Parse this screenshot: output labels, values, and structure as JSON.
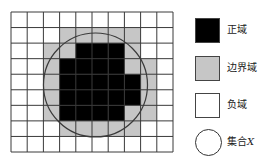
{
  "diagram": {
    "title": "",
    "grid": {
      "rows": 9,
      "cols": 10,
      "cells": [
        "WWWWWWWWWW",
        "WWWGGGGGWW",
        "WWGGBBBGWW",
        "WWGBBBBGGW",
        "WWGBBBBBGW",
        "WWGBBBBBGW",
        "WWGBBBBGGW",
        "WWWGGGGGWW",
        "WWWWWWWWWW"
      ],
      "cell_legend": {
        "B": "正域",
        "G": "边界域",
        "W": "负域"
      }
    },
    "circle": {
      "label": "集合X"
    },
    "colors": {
      "positive_region": "#000000",
      "boundary_region": "#c6c6c6",
      "negative_region": "#ffffff",
      "grid_lines": "#3a3a3a",
      "circle_stroke": "#3a3a3a"
    }
  },
  "legend": {
    "items": [
      {
        "label": "正域",
        "swatch": "black-square"
      },
      {
        "label": "边界域",
        "swatch": "gray-square"
      },
      {
        "label": "负域",
        "swatch": "white-square"
      },
      {
        "label": "集合",
        "label_var": "X",
        "swatch": "circle"
      }
    ]
  }
}
